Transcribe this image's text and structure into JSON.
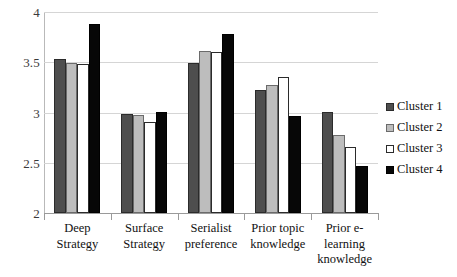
{
  "chart_data": {
    "type": "bar",
    "title": "",
    "subtitle": "",
    "xlabel": "",
    "ylabel": "",
    "ylim": [
      2,
      4
    ],
    "ytick_labels": [
      "4",
      "3.5",
      "3",
      "2.5",
      "2"
    ],
    "ytick_values": [
      4,
      3.5,
      3,
      2.5,
      2
    ],
    "grid": true,
    "legend_position": "right",
    "categories": [
      "Deep Strategy",
      "Surface Strategy",
      "Serialist preference",
      "Prior topic knowledge",
      "Prior e-learning knowledge"
    ],
    "category_lines": [
      [
        "Deep",
        "Strategy"
      ],
      [
        "Surface",
        "Strategy"
      ],
      [
        "Serialist",
        "preference"
      ],
      [
        "Prior topic",
        "knowledge"
      ],
      [
        "Prior e-",
        "learning",
        "knowledge"
      ]
    ],
    "series": [
      {
        "name": "Cluster 1",
        "color": "#4e4e4e",
        "values": [
          3.53,
          2.99,
          3.49,
          3.22,
          3.01
        ]
      },
      {
        "name": "Cluster 2",
        "color": "#bdbdbd",
        "values": [
          3.49,
          2.98,
          3.61,
          3.27,
          2.78
        ]
      },
      {
        "name": "Cluster 3",
        "color": "#ffffff",
        "values": [
          3.48,
          2.91,
          3.6,
          3.35,
          2.66
        ]
      },
      {
        "name": "Cluster 4",
        "color": "#070707",
        "values": [
          3.88,
          3.01,
          3.78,
          2.97,
          2.47
        ]
      }
    ]
  },
  "legend": {
    "items": [
      {
        "label": "Cluster 1",
        "swatch": "dark-gray"
      },
      {
        "label": "Cluster 2",
        "swatch": "light-gray"
      },
      {
        "label": "Cluster 3",
        "swatch": "white"
      },
      {
        "label": "Cluster 4",
        "swatch": "black"
      }
    ]
  }
}
